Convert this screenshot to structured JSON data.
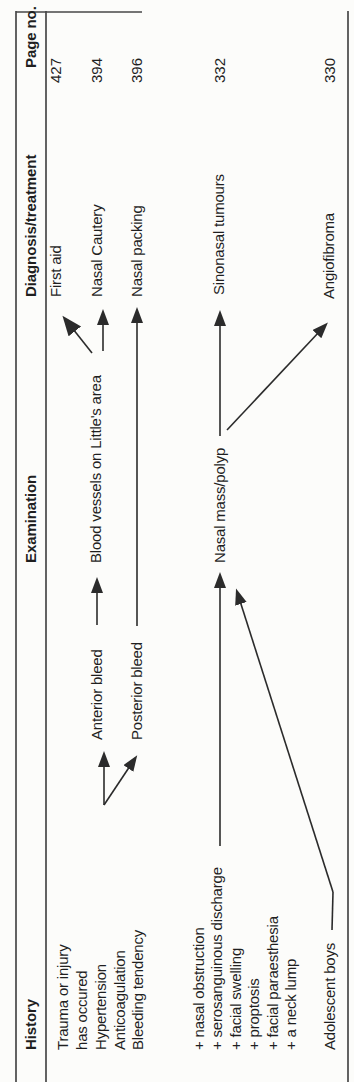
{
  "meta": {
    "kind": "scanned textbook flow-table",
    "orientation": "table rotated 90deg counter-clockwise on page",
    "topic": "Nasal bleeding / nasal mass flowchart"
  },
  "colors": {
    "ink": "#1f1f1f",
    "rule": "#474747",
    "arrow": "#2b2b2b",
    "background": "#fcfcfa"
  },
  "columns": {
    "history": {
      "header": "History",
      "items": [
        {
          "text": "Trauma or injury"
        },
        {
          "text": "has occured"
        },
        {
          "text": "Hypertension"
        },
        {
          "text": "Anticoagulation"
        },
        {
          "text": "Bleeding tendency"
        },
        {
          "text": "+ nasal obstruction"
        },
        {
          "text": "+ serosanguinous discharge"
        },
        {
          "text": "+ facial swelling"
        },
        {
          "text": "+ proptosis"
        },
        {
          "text": "+ facial paraesthesia"
        },
        {
          "text": "+ a neck lump"
        },
        {
          "text": "Adolescent boys"
        }
      ]
    },
    "examination": {
      "header": "Examination",
      "items": [
        {
          "text": "Anterior bleed"
        },
        {
          "text": "Posterior bleed"
        },
        {
          "text": "Blood vessels on Little's area"
        },
        {
          "text": "Nasal mass/polyp"
        }
      ]
    },
    "diagnosis": {
      "header": "Diagnosis/treatment",
      "items": [
        {
          "text": "First aid"
        },
        {
          "text": "Nasal Cautery"
        },
        {
          "text": "Nasal packing"
        },
        {
          "text": "Sinonasal tumours"
        },
        {
          "text": "Angiofibroma"
        }
      ]
    },
    "page_no": {
      "header": "Page no.",
      "items": [
        {
          "text": "427"
        },
        {
          "text": "394"
        },
        {
          "text": "396"
        },
        {
          "text": "332"
        },
        {
          "text": "330"
        }
      ]
    }
  },
  "arrows": [
    {
      "from": "Trauma or injury has occured / Hypertension / Anticoagulation / Bleeding tendency",
      "to": "Anterior bleed"
    },
    {
      "from": "Trauma or injury has occured / Hypertension / Anticoagulation / Bleeding tendency",
      "to": "Posterior bleed"
    },
    {
      "from": "Anterior bleed",
      "to": "Blood vessels on Little's area"
    },
    {
      "from": "Blood vessels on Little's area",
      "to": "First aid"
    },
    {
      "from": "Blood vessels on Little's area",
      "to": "Nasal Cautery"
    },
    {
      "from": "Posterior bleed",
      "to": "Nasal packing"
    },
    {
      "from": "+ serosanguinous discharge (symptom list)",
      "to": "Nasal mass/polyp"
    },
    {
      "from": "Adolescent boys",
      "to": "Nasal mass/polyp"
    },
    {
      "from": "Nasal mass/polyp",
      "to": "Sinonasal tumours"
    },
    {
      "from": "Nasal mass/polyp",
      "to": "Angiofibroma"
    }
  ]
}
